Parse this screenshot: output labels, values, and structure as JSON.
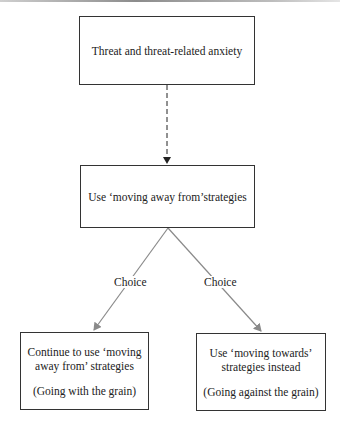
{
  "diagram": {
    "nodes": {
      "threat": {
        "text": "Threat and threat-related anxiety"
      },
      "moving_away": {
        "text": "Use ‘moving away from’strategies"
      },
      "continue": {
        "line1": "Continue to use ‘moving",
        "line2": "away from’ strategies",
        "note": "(Going with the grain)"
      },
      "towards": {
        "line1": "Use ‘moving towards’",
        "line2": "strategies instead",
        "note": "(Going against the grain)"
      }
    },
    "edges": [
      {
        "from": "threat",
        "to": "moving_away",
        "style": "dashed",
        "label": ""
      },
      {
        "from": "moving_away",
        "to": "continue",
        "style": "solid-grey",
        "label": "Choice"
      },
      {
        "from": "moving_away",
        "to": "towards",
        "style": "solid-grey",
        "label": "Choice"
      }
    ],
    "colors": {
      "box_border": "#333333",
      "dashed_arrow": "#222222",
      "choice_arrow": "#8a8a8a"
    }
  }
}
